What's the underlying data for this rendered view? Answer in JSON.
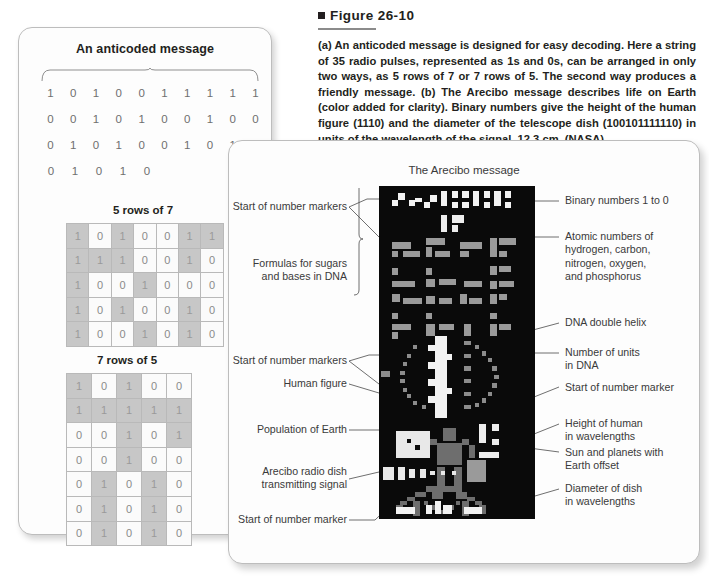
{
  "figure": {
    "label": "Figure 26-10",
    "caption": "(a) An anticoded message is designed for easy decoding. Here a string of 35 radio pulses, represented as 1s and 0s, can be arranged in only two ways, as 5 rows of 7 or 7 rows of 5. The second way produces a friendly message. (b) The Arecibo message describes life on Earth (color added for clarity). Binary numbers give the height of the human figure (1110) and the diameter of the telescope dish (100101111110) in units of the wavelength of the signal, 12.3 cm. (NASA)"
  },
  "panel_a": {
    "title": "An anticoded message",
    "bit_rows": [
      [
        "1",
        "0",
        "1",
        "0",
        "0",
        "1",
        "1",
        "1",
        "1",
        "1"
      ],
      [
        "0",
        "0",
        "1",
        "0",
        "1",
        "0",
        "0",
        "1",
        "0",
        "0"
      ],
      [
        "0",
        "1",
        "0",
        "1",
        "0",
        "0",
        "1",
        "0",
        "1",
        "0"
      ],
      [
        "0",
        "1",
        "0",
        "1",
        "0"
      ]
    ],
    "grid_5x7": {
      "heading": "5 rows of 7",
      "rows": [
        [
          "1",
          "0",
          "1",
          "0",
          "0",
          "1",
          "1"
        ],
        [
          "1",
          "1",
          "1",
          "0",
          "0",
          "1",
          "0"
        ],
        [
          "1",
          "0",
          "0",
          "1",
          "0",
          "0",
          "0"
        ],
        [
          "1",
          "0",
          "1",
          "0",
          "0",
          "1",
          "0"
        ],
        [
          "1",
          "0",
          "0",
          "1",
          "0",
          "1",
          "0"
        ]
      ]
    },
    "grid_7x5": {
      "heading": "7 rows of 5",
      "rows": [
        [
          "1",
          "0",
          "1",
          "0",
          "0"
        ],
        [
          "1",
          "1",
          "1",
          "1",
          "1"
        ],
        [
          "0",
          "0",
          "1",
          "0",
          "1"
        ],
        [
          "0",
          "0",
          "1",
          "0",
          "0"
        ],
        [
          "0",
          "1",
          "0",
          "1",
          "0"
        ],
        [
          "0",
          "1",
          "0",
          "1",
          "0"
        ],
        [
          "0",
          "1",
          "0",
          "1",
          "0"
        ]
      ]
    }
  },
  "panel_b": {
    "title": "The Arecibo message",
    "labels_left": [
      "Start of number markers",
      "Formulas for sugars\nand bases in DNA",
      "Start of number markers",
      "Human figure",
      "Population of Earth",
      "Arecibo radio dish\ntransmitting signal",
      "Start of number marker"
    ],
    "labels_right": [
      "Binary numbers 1 to 0",
      "Atomic numbers of\nhydrogen, carbon,\nnitrogen, oxygen,\nand phosphorus",
      "DNA double helix",
      "Number of units\nin DNA",
      "Start of number marker",
      "Height of human\nin wavelengths",
      "Sun and planets with\nEarth offset",
      "Diameter of dish\nin wavelengths"
    ]
  },
  "colors": {
    "page_bg": "#ffffff",
    "card_bg": "#fdfdfd",
    "card_border": "#bdbdbd",
    "cell_on": "#c7c7c7",
    "cell_off": "#fbfbfb",
    "image_bg": "#0a0a0a",
    "text": "#231f20"
  }
}
